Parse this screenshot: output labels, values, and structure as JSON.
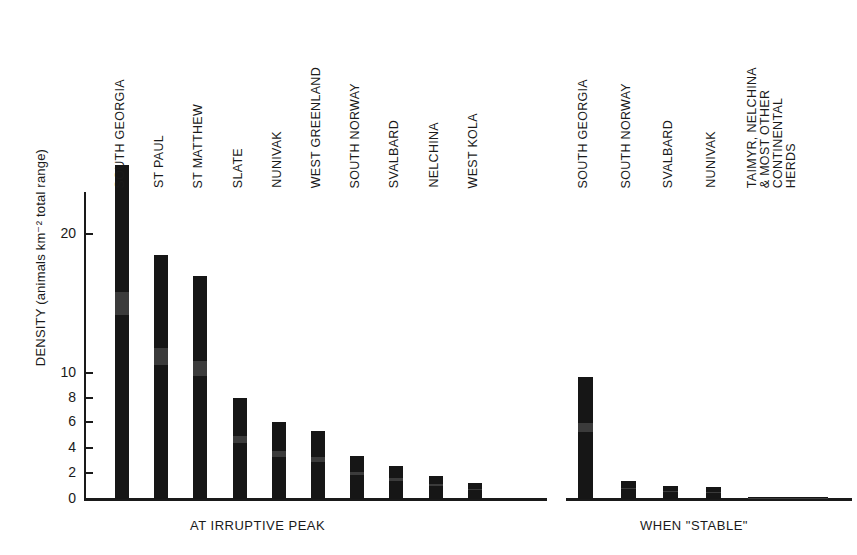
{
  "chart_data": {
    "type": "bar",
    "title": "",
    "xlabel": "",
    "ylabel": "DENSITY (animals km⁻² total range)",
    "ylim": [
      0,
      26
    ],
    "grid": false,
    "legend": "none",
    "y_ticks": [
      0,
      2,
      4,
      6,
      8,
      10,
      20
    ],
    "y_tick_labels": [
      "0",
      "2",
      "4",
      "6",
      "8",
      "10",
      "20"
    ],
    "groups": [
      {
        "caption": "AT IRRUPTIVE PEAK",
        "categories": [
          "SOUTH GEORGIA",
          "ST PAUL",
          "ST MATTHEW",
          "SLATE",
          "NUNIVAK",
          "WEST GREENLAND",
          "SOUTH NORWAY",
          "SVALBARD",
          "NELCHINA",
          "WEST KOLA"
        ],
        "values": [
          25.0,
          18.5,
          17.0,
          8.0,
          6.0,
          5.3,
          3.4,
          2.6,
          1.8,
          1.2
        ]
      },
      {
        "caption": "WHEN \"STABLE\"",
        "categories": [
          "SOUTH GEORGIA",
          "SOUTH NORWAY",
          "SVALBARD",
          "NUNIVAK",
          "TAIMYR, NELCHINA\n& MOST OTHER\nCONTINENTAL\nHERDS"
        ],
        "values": [
          9.7,
          1.4,
          1.0,
          0.9,
          0.15
        ]
      }
    ],
    "bar_color": "#161616"
  }
}
